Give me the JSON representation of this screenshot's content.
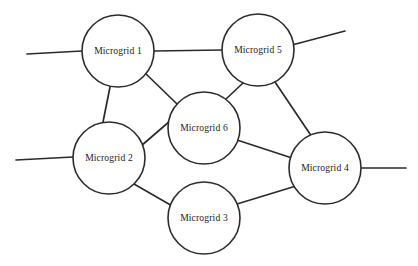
{
  "diagram": {
    "type": "node-link-graph",
    "canvas": {
      "width": 418,
      "height": 266
    },
    "style": {
      "background_color": "#ffffff",
      "line_color": "#2b2b2b",
      "node_fill_color": "#ffffff",
      "node_stroke_color": "#2b2b2b",
      "label_color": "#1b1b1b",
      "node_radius": 36,
      "line_width": 1.7
    },
    "nodes": [
      {
        "id": "mg1",
        "label": "Microgrid 1",
        "cx": 118,
        "cy": 51,
        "r": 36
      },
      {
        "id": "mg2",
        "label": "Microgrid 2",
        "cx": 109,
        "cy": 158,
        "r": 36
      },
      {
        "id": "mg3",
        "label": "Microgrid 3",
        "cx": 204,
        "cy": 218,
        "r": 36
      },
      {
        "id": "mg4",
        "label": "Microgrid 4",
        "cx": 325,
        "cy": 168,
        "r": 36
      },
      {
        "id": "mg5",
        "label": "Microgrid 5",
        "cx": 258,
        "cy": 50,
        "r": 36
      },
      {
        "id": "mg6",
        "label": "Microgrid 6",
        "cx": 204,
        "cy": 128,
        "r": 36
      }
    ],
    "edges": [
      {
        "id": "e-mg1-mg5",
        "from": "mg1",
        "to": "mg5",
        "x1": 154,
        "y1": 51,
        "x2": 222,
        "y2": 50
      },
      {
        "id": "e-mg1-mg2",
        "from": "mg1",
        "to": "mg2",
        "x1": 110,
        "y1": 87,
        "x2": 103,
        "y2": 122
      },
      {
        "id": "e-mg1-mg6",
        "from": "mg1",
        "to": "mg6",
        "x1": 144,
        "y1": 72,
        "x2": 177,
        "y2": 104
      },
      {
        "id": "e-mg5-mg6",
        "from": "mg5",
        "to": "mg6",
        "x1": 243,
        "y1": 83,
        "x2": 226,
        "y2": 99
      },
      {
        "id": "e-mg5-mg4",
        "from": "mg5",
        "to": "mg4",
        "x1": 275,
        "y1": 82,
        "x2": 310,
        "y2": 134
      },
      {
        "id": "e-mg2-mg6",
        "from": "mg2",
        "to": "mg6",
        "x1": 141,
        "y1": 146,
        "x2": 170,
        "y2": 121
      },
      {
        "id": "e-mg2-mg3",
        "from": "mg2",
        "to": "mg3",
        "x1": 134,
        "y1": 184,
        "x2": 174,
        "y2": 207
      },
      {
        "id": "e-mg3-mg4",
        "from": "mg3",
        "to": "mg4",
        "x1": 237,
        "y1": 204,
        "x2": 296,
        "y2": 186
      },
      {
        "id": "e-mg6-mg4",
        "from": "mg6",
        "to": "mg4",
        "x1": 237,
        "y1": 140,
        "x2": 292,
        "y2": 158
      }
    ],
    "external_connections": [
      {
        "id": "stub-mg1-left",
        "node": "mg1",
        "x1": 27,
        "y1": 54,
        "x2": 82,
        "y2": 51
      },
      {
        "id": "stub-mg2-left",
        "node": "mg2",
        "x1": 16,
        "y1": 160,
        "x2": 73,
        "y2": 157
      },
      {
        "id": "stub-mg5-upper-right",
        "node": "mg5",
        "x1": 292,
        "y1": 45,
        "x2": 345,
        "y2": 31
      },
      {
        "id": "stub-mg4-right",
        "node": "mg4",
        "x1": 361,
        "y1": 168,
        "x2": 406,
        "y2": 168
      }
    ]
  }
}
